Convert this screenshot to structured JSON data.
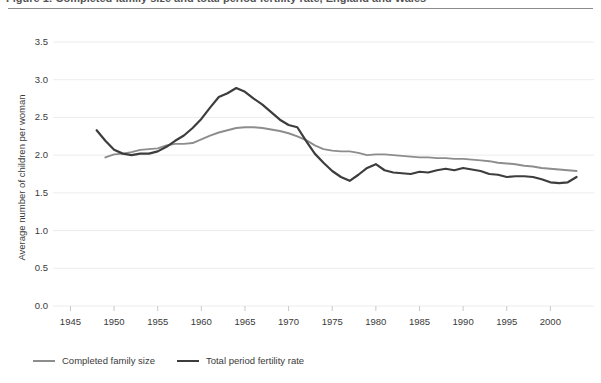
{
  "figure": {
    "caption": "Figure 1: Completed family size and total period fertility rate, England and Wales",
    "caption_visible": "partially cut off at top edge"
  },
  "chart_data": {
    "type": "line",
    "title": "",
    "xlabel": "",
    "ylabel": "Average number of children per woman",
    "xlim": [
      1943,
      2005
    ],
    "ylim": [
      0.0,
      3.5
    ],
    "grid": "horizontal",
    "legend_position": "bottom-left",
    "xticks": [
      1945,
      1950,
      1955,
      1960,
      1965,
      1970,
      1975,
      1980,
      1985,
      1990,
      1995,
      2000
    ],
    "yticks": [
      "0.0",
      "0.5",
      "1.0",
      "1.5",
      "2.0",
      "2.5",
      "3.0",
      "3.5"
    ],
    "colors": {
      "completed_family_size": "#8d8d8d",
      "total_period_fertility_rate": "#3d3d3d",
      "gridline": "#ececec",
      "background": "#ffffff"
    },
    "series": [
      {
        "name": "Completed family size",
        "color": "#8d8d8d",
        "width": 1.9,
        "x": [
          1949,
          1950,
          1951,
          1952,
          1953,
          1954,
          1955,
          1956,
          1957,
          1958,
          1959,
          1960,
          1961,
          1962,
          1963,
          1964,
          1965,
          1966,
          1967,
          1968,
          1969,
          1970,
          1971,
          1972,
          1973,
          1974,
          1975,
          1976,
          1977,
          1978,
          1979,
          1980,
          1981,
          1982,
          1983,
          1984,
          1985,
          1986,
          1987,
          1988,
          1989,
          1990,
          1991,
          1992,
          1993,
          1994,
          1995,
          1996,
          1997,
          1998,
          1999,
          2000,
          2001,
          2002,
          2003
        ],
        "values": [
          1.97,
          2.01,
          2.02,
          2.04,
          2.07,
          2.08,
          2.09,
          2.13,
          2.15,
          2.15,
          2.16,
          2.21,
          2.26,
          2.3,
          2.33,
          2.36,
          2.37,
          2.37,
          2.36,
          2.34,
          2.32,
          2.29,
          2.25,
          2.2,
          2.13,
          2.08,
          2.06,
          2.05,
          2.05,
          2.03,
          2.0,
          2.01,
          2.01,
          2.0,
          1.99,
          1.98,
          1.97,
          1.97,
          1.96,
          1.96,
          1.95,
          1.95,
          1.94,
          1.93,
          1.92,
          1.9,
          1.89,
          1.88,
          1.86,
          1.85,
          1.83,
          1.82,
          1.81,
          1.8,
          1.79
        ]
      },
      {
        "name": "Total period fertility rate",
        "color": "#3d3d3d",
        "width": 2.2,
        "x": [
          1948,
          1949,
          1950,
          1951,
          1952,
          1953,
          1954,
          1955,
          1956,
          1957,
          1958,
          1959,
          1960,
          1961,
          1962,
          1963,
          1964,
          1965,
          1966,
          1967,
          1968,
          1969,
          1970,
          1971,
          1972,
          1973,
          1974,
          1975,
          1976,
          1977,
          1978,
          1979,
          1980,
          1981,
          1982,
          1983,
          1984,
          1985,
          1986,
          1987,
          1988,
          1989,
          1990,
          1991,
          1992,
          1993,
          1994,
          1995,
          1996,
          1997,
          1998,
          1999,
          2000,
          2001,
          2002,
          2003
        ],
        "values": [
          2.33,
          2.19,
          2.07,
          2.02,
          2.0,
          2.02,
          2.02,
          2.05,
          2.11,
          2.19,
          2.26,
          2.36,
          2.48,
          2.63,
          2.77,
          2.82,
          2.89,
          2.84,
          2.75,
          2.67,
          2.57,
          2.47,
          2.4,
          2.37,
          2.19,
          2.02,
          1.9,
          1.79,
          1.71,
          1.66,
          1.74,
          1.83,
          1.88,
          1.8,
          1.77,
          1.76,
          1.75,
          1.78,
          1.77,
          1.8,
          1.82,
          1.8,
          1.83,
          1.81,
          1.79,
          1.75,
          1.74,
          1.71,
          1.72,
          1.72,
          1.71,
          1.68,
          1.64,
          1.63,
          1.64,
          1.71
        ]
      }
    ]
  }
}
